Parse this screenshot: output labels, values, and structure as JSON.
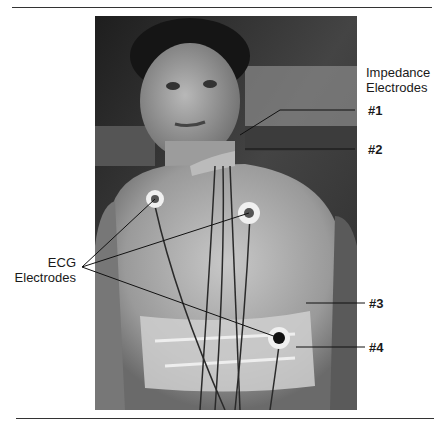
{
  "figure": {
    "labels": {
      "impedance_heading_line1": "Impedance",
      "impedance_heading_line2": "Electrodes",
      "electrode_1": "#1",
      "electrode_2": "#2",
      "electrode_3": "#3",
      "electrode_4": "#4",
      "ecg_line1": "ECG",
      "ecg_line2": "Electrodes"
    }
  }
}
